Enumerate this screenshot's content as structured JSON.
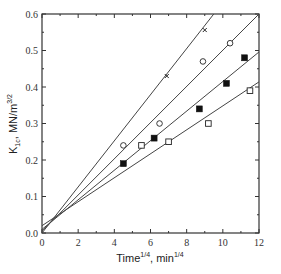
{
  "chart_data": {
    "type": "scatter",
    "title": "",
    "xlabel": "Time^1/4, min^1/4",
    "ylabel": "K1c, MN/m^3/2",
    "xlabel_parts": {
      "base": "Time",
      "sup1": "1/4",
      "mid": ", min",
      "sup2": "1/4"
    },
    "ylabel_parts": {
      "base": "K",
      "sub": "1c",
      "mid": ", MN/m",
      "sup": "3/2"
    },
    "xlim": [
      0,
      12
    ],
    "ylim": [
      0,
      0.6
    ],
    "xticks": [
      0,
      2,
      4,
      6,
      8,
      10,
      12
    ],
    "xtick_labels": [
      "0",
      "2",
      "4",
      "6",
      "8",
      "10",
      "12"
    ],
    "yticks": [
      0.0,
      0.1,
      0.2,
      0.3,
      0.4,
      0.5,
      0.6
    ],
    "ytick_labels": [
      "0.0",
      "0.1",
      "0.2",
      "0.3",
      "0.4",
      "0.5",
      "0.6"
    ],
    "grid": false,
    "legend": null,
    "series": [
      {
        "name": "cross",
        "marker": "x",
        "x": [
          6.9,
          9.0
        ],
        "y": [
          0.43,
          0.556
        ],
        "fit_line": [
          [
            0,
            0.0
          ],
          [
            9.5,
            0.6
          ]
        ]
      },
      {
        "name": "open-circle",
        "marker": "open-circle",
        "x": [
          4.5,
          6.5,
          8.9,
          10.4
        ],
        "y": [
          0.24,
          0.3,
          0.47,
          0.52
        ],
        "fit_line": [
          [
            0,
            0.005
          ],
          [
            12,
            0.6
          ]
        ]
      },
      {
        "name": "filled-square",
        "marker": "filled-square",
        "x": [
          4.5,
          6.2,
          8.7,
          10.2,
          11.2
        ],
        "y": [
          0.19,
          0.26,
          0.34,
          0.41,
          0.48
        ],
        "fit_line": [
          [
            0,
            0.01
          ],
          [
            12,
            0.496
          ]
        ]
      },
      {
        "name": "open-square",
        "marker": "open-square",
        "x": [
          5.5,
          7.0,
          9.2,
          11.5
        ],
        "y": [
          0.24,
          0.25,
          0.3,
          0.39
        ],
        "fit_line": [
          [
            0,
            0.02
          ],
          [
            12,
            0.414
          ]
        ]
      }
    ]
  }
}
